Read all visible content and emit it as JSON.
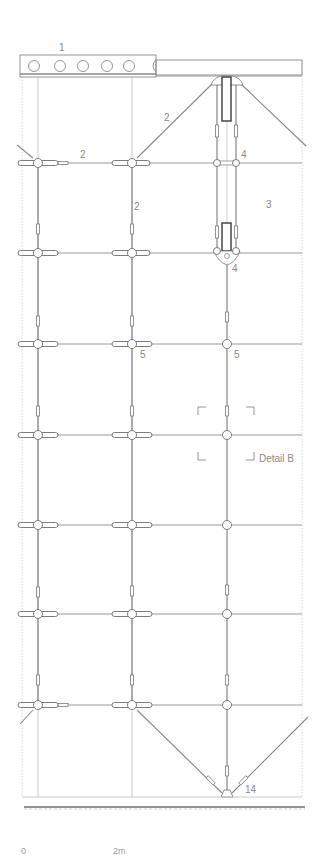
{
  "drawing": {
    "title": "Cable net glass facade elevation",
    "labels": {
      "beam": "1",
      "cable_diag_top": "2",
      "cable_horizontal": "2",
      "cable_vertical": "2",
      "glass_panel": "3",
      "node_top": "4",
      "node_bottom": "4",
      "clamp_left": "5",
      "clamp_right": "5",
      "ground_anchor": "14",
      "detail_ref": "Detail B"
    },
    "scale_bar": {
      "start": "0",
      "end": "2m"
    },
    "colors": {
      "line": "#9a9a9a",
      "line_dark": "#6e6e6e",
      "frame": "#c4c4c4",
      "label": "#8a8a8a",
      "ground": "#2a2a2a"
    }
  }
}
